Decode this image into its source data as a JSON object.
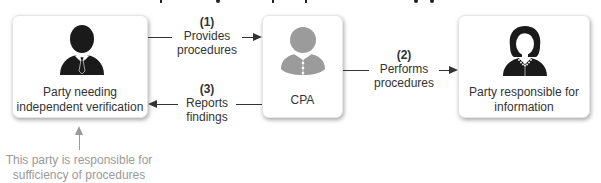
{
  "title": {
    "text": "",
    "note": "Title text is cropped at top edge; only descenders visible"
  },
  "nodes": [
    {
      "id": "party-needing-verification",
      "icon": "businessman-icon",
      "label_lines": [
        "Party needing",
        "independent verification"
      ],
      "icon_color": "#1a1a1a"
    },
    {
      "id": "cpa",
      "icon": "cpa-person-icon",
      "label_lines": [
        "CPA"
      ],
      "icon_color": "#9b9b9b"
    },
    {
      "id": "party-responsible-for-information",
      "icon": "businesswoman-icon",
      "label_lines": [
        "Party responsible for",
        "information"
      ],
      "icon_color": "#1a1a1a"
    }
  ],
  "connections": [
    {
      "step": "(1)",
      "label_lines": [
        "Provides",
        "procedures"
      ],
      "from": "party-needing-verification",
      "to": "cpa",
      "direction": "right"
    },
    {
      "step": "(2)",
      "label_lines": [
        "Performs",
        "procedures"
      ],
      "from": "cpa",
      "to": "party-responsible-for-information",
      "direction": "right"
    },
    {
      "step": "(3)",
      "label_lines": [
        "Reports",
        "findings"
      ],
      "from": "cpa",
      "to": "party-needing-verification",
      "direction": "left"
    }
  ],
  "annotation": {
    "target": "party-needing-verification",
    "lines": [
      "This party is responsible for",
      "sufficiency of procedures"
    ],
    "color": "#9a9a9a"
  },
  "colors": {
    "line": "#333333",
    "text": "#333333",
    "muted": "#9a9a9a",
    "box_bg": "#ffffff"
  }
}
